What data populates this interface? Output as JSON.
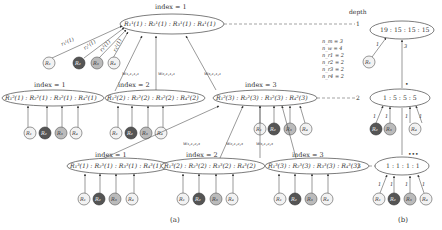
{
  "figure": {
    "panel_a_caption": "(a)",
    "panel_b_caption": "(b)",
    "depth_label": "depth",
    "depth_levels": [
      "1",
      "2",
      "3"
    ]
  },
  "panel_a": {
    "root": {
      "index_label": "index = 1",
      "text": "R₁¹(1) : R₂¹(1) : R₃¹(1) : R₄¹(1)"
    },
    "root_leaf_edges": [
      "r₁¹(1)",
      "r₂¹(1)",
      "r₃¹(1)",
      "r₄¹(1)"
    ],
    "root_to_level2_weights": [
      "w₁,₁,₁,₁",
      "w₂,₁,₁,₁",
      "w₃,₁,₁,₁"
    ],
    "level2": [
      {
        "index_label": "index = 1",
        "text": "R₁²(1) : R₂²(1) : R₃²(1) : R₄²(1)"
      },
      {
        "index_label": "index = 2",
        "text": "R₁²(2) : R₂²(2) : R₃²(2) : R₄²(2)"
      },
      {
        "index_label": "index = 3",
        "text": "R₁²(3) : R₂²(3) : R₃²(3) : R₄²(3)"
      }
    ],
    "level3_weights": [
      "w₁,₁,₂,₃",
      "w₂,₁,₂,₃",
      "w₃,₁,₂,₃"
    ],
    "level2_index3_weights": [
      "w₁,₁,₂,₃",
      "w₂,₁,₂,₃"
    ],
    "level3": [
      {
        "index_label": "index = 1",
        "text": "R₁³(1) : R₂³(1) : R₃³(1) : R₄³(1)"
      },
      {
        "index_label": "index = 2",
        "text": "R₁³(2) : R₂³(2) : R₃³(2) : R₄³(2)"
      },
      {
        "index_label": "index = 3",
        "text": "R₁³(3) : R₂³(3) : R₃³(3) : R₄³(3)"
      }
    ],
    "leaves": [
      "R₁",
      "R₂",
      "R₃",
      "R₄"
    ]
  },
  "panel_b": {
    "params": [
      "n_m = 3",
      "n_w = 4",
      "n_r1 = 2",
      "n_r2 = 2",
      "n_r3 = 2",
      "n_r4 = 2"
    ],
    "nodes": [
      {
        "depth": "1",
        "text": "19 : 15 : 15 : 15"
      },
      {
        "depth": "2",
        "text": "1 : 5 : 5 : 5"
      },
      {
        "depth": "3",
        "text": "1 : 1 : 1 : 1"
      }
    ],
    "edge_labels_top": [
      "1",
      "3"
    ],
    "edge_labels_mid": [
      "1",
      "1",
      "1",
      "1"
    ],
    "edge_labels_bottom": [
      "1",
      "1",
      "1",
      "1"
    ],
    "leaves": [
      "R₁",
      "R₂",
      "R₃",
      "R₄"
    ],
    "marker_mid": "•",
    "marker_bottom": "•••"
  }
}
